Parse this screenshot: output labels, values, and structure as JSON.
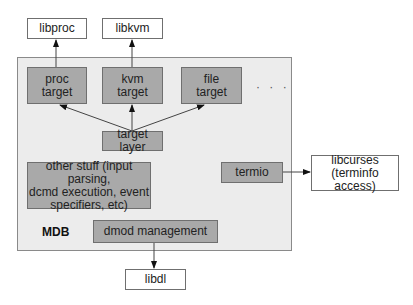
{
  "diagram": {
    "container": {
      "label": "MDB"
    },
    "external": {
      "libproc": "libproc",
      "libkvm": "libkvm",
      "libdl": "libdl",
      "libcurses_line1": "libcurses",
      "libcurses_line2": "(terminfo access)"
    },
    "internal": {
      "proc_target_line1": "proc",
      "proc_target_line2": "target",
      "kvm_target_line1": "kvm",
      "kvm_target_line2": "target",
      "file_target_line1": "file",
      "file_target_line2": "target",
      "ellipsis": "· · ·",
      "target_layer": "target layer",
      "other_stuff_line1": "other stuff (input parsing,",
      "other_stuff_line2": "dcmd execution, event",
      "other_stuff_line3": "specifiers, etc)",
      "termio": "termio",
      "dmod_management": "dmod management"
    },
    "edges": [
      {
        "from": "proc target",
        "to": "libproc"
      },
      {
        "from": "kvm target",
        "to": "libkvm"
      },
      {
        "from": "target layer",
        "to": "proc target"
      },
      {
        "from": "target layer",
        "to": "kvm target"
      },
      {
        "from": "target layer",
        "to": "file target"
      },
      {
        "from": "termio",
        "to": "libcurses (terminfo access)"
      },
      {
        "from": "dmod management",
        "to": "libdl"
      }
    ],
    "colors": {
      "container_fill": "#ececec",
      "component_fill": "#a9a9a9",
      "external_fill": "#ffffff",
      "border": "#6f6f6f"
    }
  }
}
